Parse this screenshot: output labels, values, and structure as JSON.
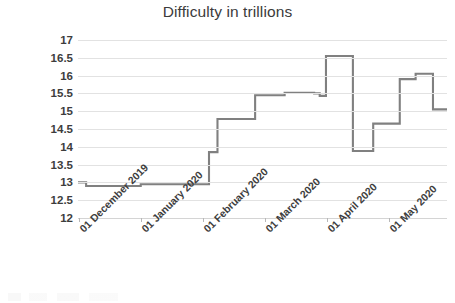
{
  "chart_data": {
    "type": "line",
    "title": "Difficulty in trillions",
    "xlabel": "",
    "ylabel": "",
    "ylim": [
      12,
      17
    ],
    "ytick_step": 0.5,
    "yticks": [
      "17",
      "16.5",
      "16",
      "15.5",
      "15",
      "14.5",
      "14",
      "13.5",
      "13",
      "12.5",
      "12"
    ],
    "grid": true,
    "legend": false,
    "line_style": "step",
    "line_color": "#808080",
    "x_tick_labels": [
      "01 December 2019",
      "01 January 2020",
      "01 February 2020",
      "01 March 2020",
      "01 April 2020",
      "01 May 2020"
    ],
    "x_tick_label_rotation": -45,
    "x_range_start": "01 December 2019",
    "x_range_end": "mid May 2020",
    "series": [
      {
        "name": "Difficulty",
        "values": [
          13.0,
          12.9,
          12.9,
          12.95,
          12.95,
          13.85,
          13.85,
          14.78,
          14.78,
          15.45,
          15.52,
          15.5,
          15.43,
          16.55,
          16.55,
          13.88,
          13.88,
          14.65,
          14.65,
          15.9,
          16.05,
          16.05,
          15.05,
          15.05
        ],
        "step_points": [
          {
            "x_frac": 0.0,
            "value": 13.0
          },
          {
            "x_frac": 0.022,
            "value": 12.9
          },
          {
            "x_frac": 0.17,
            "value": 12.95
          },
          {
            "x_frac": 0.355,
            "value": 13.85
          },
          {
            "x_frac": 0.365,
            "value": 13.85
          },
          {
            "x_frac": 0.378,
            "value": 14.78
          },
          {
            "x_frac": 0.48,
            "value": 15.45
          },
          {
            "x_frac": 0.56,
            "value": 15.52
          },
          {
            "x_frac": 0.64,
            "value": 15.5
          },
          {
            "x_frac": 0.655,
            "value": 15.43
          },
          {
            "x_frac": 0.672,
            "value": 16.55
          },
          {
            "x_frac": 0.74,
            "value": 16.55
          },
          {
            "x_frac": 0.745,
            "value": 13.88
          },
          {
            "x_frac": 0.79,
            "value": 13.88
          },
          {
            "x_frac": 0.8,
            "value": 14.65
          },
          {
            "x_frac": 0.862,
            "value": 14.65
          },
          {
            "x_frac": 0.872,
            "value": 15.9
          },
          {
            "x_frac": 0.915,
            "value": 16.05
          },
          {
            "x_frac": 0.955,
            "value": 16.05
          },
          {
            "x_frac": 0.962,
            "value": 15.05
          },
          {
            "x_frac": 1.0,
            "value": 15.05
          }
        ]
      }
    ]
  }
}
